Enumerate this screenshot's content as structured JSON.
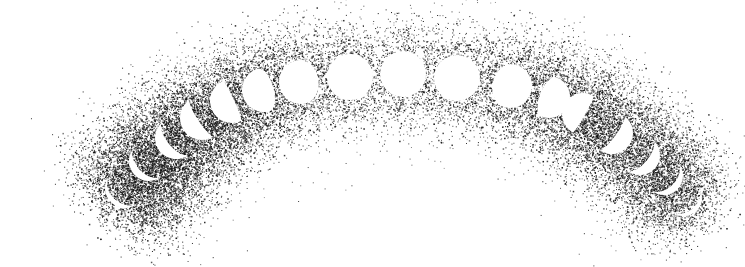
{
  "illustration": {
    "subject": "moon phases along an arc",
    "style": "stipple",
    "ink_color": "#111111",
    "background_color": "#ffffff",
    "moon_color": "#ffffff",
    "arc": {
      "start": [
        95,
        215
      ],
      "peak": [
        400,
        55
      ],
      "end": [
        705,
        225
      ]
    },
    "moons": [
      {
        "x": 125,
        "y": 188,
        "r": 20,
        "phase": "waxing-crescent",
        "lit": 0.12,
        "density": 1.0
      },
      {
        "x": 149,
        "y": 161,
        "r": 20,
        "phase": "waxing-crescent",
        "lit": 0.18,
        "density": 0.95
      },
      {
        "x": 176,
        "y": 138,
        "r": 21,
        "phase": "waxing-crescent",
        "lit": 0.28,
        "density": 0.85
      },
      {
        "x": 202,
        "y": 118,
        "r": 22,
        "phase": "waxing-crescent",
        "lit": 0.4,
        "density": 0.7
      },
      {
        "x": 232,
        "y": 101,
        "r": 22,
        "phase": "first-quarter",
        "lit": 0.55,
        "density": 0.6
      },
      {
        "x": 264,
        "y": 90,
        "r": 22,
        "phase": "waxing-gibbous",
        "lit": 0.72,
        "density": 0.5
      },
      {
        "x": 301,
        "y": 82,
        "r": 22,
        "phase": "waxing-gibbous",
        "lit": 0.9,
        "density": 0.45
      },
      {
        "x": 350,
        "y": 77,
        "r": 23,
        "phase": "full",
        "lit": 1.0,
        "density": 0.42
      },
      {
        "x": 403,
        "y": 74,
        "r": 23,
        "phase": "full",
        "lit": 1.0,
        "density": 0.42
      },
      {
        "x": 457,
        "y": 78,
        "r": 23,
        "phase": "full",
        "lit": 1.0,
        "density": 0.45
      },
      {
        "x": 510,
        "y": 86,
        "r": 22,
        "phase": "waning-gibbous",
        "lit": 0.9,
        "density": 0.5
      },
      {
        "x": 549,
        "y": 97,
        "r": 21,
        "phase": "waning-gibbous",
        "lit": 0.72,
        "density": 0.55
      },
      {
        "x": 583,
        "y": 114,
        "r": 21,
        "phase": "last-quarter",
        "lit": 0.55,
        "density": 0.6
      },
      {
        "x": 612,
        "y": 133,
        "r": 21,
        "phase": "waning-crescent",
        "lit": 0.4,
        "density": 0.6
      },
      {
        "x": 640,
        "y": 155,
        "r": 20,
        "phase": "waning-crescent",
        "lit": 0.28,
        "density": 0.6
      },
      {
        "x": 664,
        "y": 176,
        "r": 19,
        "phase": "waning-crescent",
        "lit": 0.18,
        "density": 0.55
      },
      {
        "x": 684,
        "y": 198,
        "r": 18,
        "phase": "waning-crescent",
        "lit": 0.12,
        "density": 0.5
      }
    ]
  }
}
